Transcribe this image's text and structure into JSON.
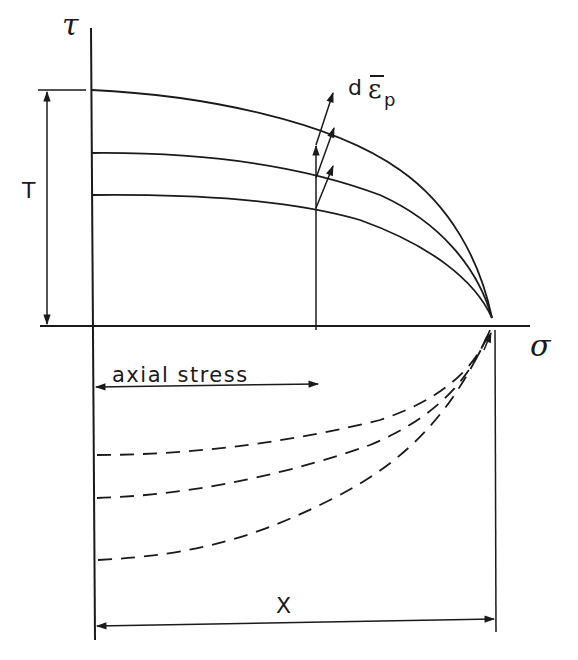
{
  "diagram": {
    "axes": {
      "vertical_label": "τ",
      "horizontal_label": "σ"
    },
    "labels": {
      "torque_dimension": "T",
      "strain_increment_prefix": "d",
      "strain_increment_symbol": "ε",
      "strain_increment_subscript": "p",
      "axial_stress_dimension": "axial stress",
      "x_dimension": "X"
    },
    "curves": {
      "solid_count": 3,
      "dashed_count": 3
    },
    "colors": {
      "ink": "#1a1a1a",
      "background": "#ffffff"
    }
  }
}
